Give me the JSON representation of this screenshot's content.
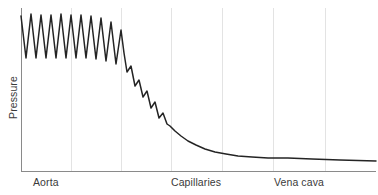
{
  "figure": {
    "background": "#ffffff",
    "line_color": "#242424",
    "axis_color": "#8a8a8a",
    "grid_color": "#e3e3e3",
    "text_color": "#3a3a3a"
  },
  "axes": {
    "ylabel": "Pressure",
    "xticks": [
      {
        "label": "Aorta",
        "x_px": 45
      },
      {
        "label": "Capillaries",
        "x_px": 197
      },
      {
        "label": "Vena cava",
        "x_px": 299
      }
    ],
    "gridlines_x_px": [
      71,
      121,
      171,
      222,
      273,
      325
    ],
    "plot_left_px": 21,
    "plot_right_px": 376,
    "plot_top_px": 8,
    "plot_bottom_px": 171
  },
  "chart_data": {
    "type": "line",
    "title": "",
    "xlabel": "",
    "ylabel": "Pressure",
    "xlim": [
      0,
      100
    ],
    "ylim": [
      0,
      100
    ],
    "grid": "vertical",
    "legend": "none",
    "tick_categories": [
      "Aorta",
      "Capillaries",
      "Vena cava"
    ],
    "series": [
      {
        "name": "Blood pressure",
        "color": "#242424",
        "comment": "x,y in pixel space of the 378x195 figure; y grows downward",
        "points": [
          [
            21,
            16
          ],
          [
            26,
            58
          ],
          [
            31,
            14
          ],
          [
            36,
            58
          ],
          [
            41,
            15
          ],
          [
            46,
            58
          ],
          [
            51,
            15
          ],
          [
            56,
            58
          ],
          [
            61,
            14
          ],
          [
            66,
            58
          ],
          [
            71,
            15
          ],
          [
            76,
            58
          ],
          [
            81,
            15
          ],
          [
            86,
            58
          ],
          [
            91,
            16
          ],
          [
            96,
            59
          ],
          [
            101,
            18
          ],
          [
            106,
            61
          ],
          [
            111,
            22
          ],
          [
            116,
            64
          ],
          [
            121,
            30
          ],
          [
            124,
            53
          ],
          [
            127,
            72
          ],
          [
            131,
            66
          ],
          [
            135,
            86
          ],
          [
            139,
            80
          ],
          [
            143,
            97
          ],
          [
            147,
            91
          ],
          [
            151,
            108
          ],
          [
            155,
            102
          ],
          [
            159,
            118
          ],
          [
            163,
            113
          ],
          [
            167,
            124
          ],
          [
            170,
            126
          ],
          [
            175,
            131
          ],
          [
            181,
            136
          ],
          [
            188,
            141
          ],
          [
            196,
            145
          ],
          [
            205,
            149
          ],
          [
            215,
            152
          ],
          [
            226,
            154
          ],
          [
            238,
            156
          ],
          [
            252,
            157
          ],
          [
            268,
            158
          ],
          [
            288,
            158
          ],
          [
            312,
            159
          ],
          [
            340,
            160
          ],
          [
            376,
            161
          ]
        ],
        "systolic_envelope_note": "peaks near y=14-16 px at the aorta, falling to y~124 px by the arterioles",
        "diastolic_envelope_note": "troughs near y=58 px at the aorta, converging with peaks near the capillaries"
      }
    ]
  }
}
